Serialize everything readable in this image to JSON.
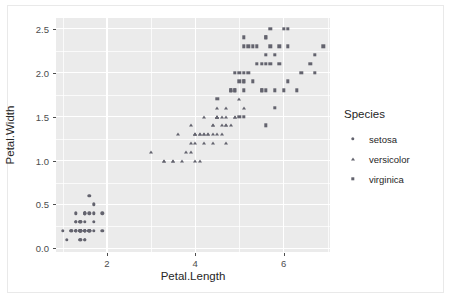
{
  "chart_data": {
    "type": "scatter",
    "title": "",
    "xlabel": "Petal.Length",
    "ylabel": "Petal.Width",
    "xlim": [
      0.85,
      7.05
    ],
    "ylim": [
      -0.04,
      2.62
    ],
    "xticks": [
      2,
      4,
      6
    ],
    "xtick_labels": [
      "2",
      "4",
      "6"
    ],
    "yticks": [
      0.0,
      0.5,
      1.0,
      1.5,
      2.0,
      2.5
    ],
    "ytick_labels": [
      "0.0",
      "0.5",
      "1.0",
      "1.5",
      "2.0",
      "2.5"
    ],
    "x_minor_ticks": [
      1,
      3,
      5,
      7
    ],
    "y_minor_ticks": [
      0.25,
      0.75,
      1.25,
      1.75,
      2.25
    ],
    "grid": true,
    "panel_background": "#ebebeb",
    "grid_color": "#ffffff",
    "marker_color": "#63636e",
    "legend_position": "right",
    "legend_title": "Species",
    "series": [
      {
        "name": "setosa",
        "marker": "circle",
        "points": [
          [
            1.4,
            0.2
          ],
          [
            1.4,
            0.2
          ],
          [
            1.3,
            0.2
          ],
          [
            1.5,
            0.2
          ],
          [
            1.4,
            0.2
          ],
          [
            1.7,
            0.4
          ],
          [
            1.4,
            0.3
          ],
          [
            1.5,
            0.2
          ],
          [
            1.4,
            0.2
          ],
          [
            1.5,
            0.1
          ],
          [
            1.5,
            0.2
          ],
          [
            1.6,
            0.2
          ],
          [
            1.4,
            0.1
          ],
          [
            1.1,
            0.1
          ],
          [
            1.2,
            0.2
          ],
          [
            1.5,
            0.4
          ],
          [
            1.3,
            0.4
          ],
          [
            1.4,
            0.3
          ],
          [
            1.7,
            0.3
          ],
          [
            1.5,
            0.3
          ],
          [
            1.7,
            0.2
          ],
          [
            1.5,
            0.4
          ],
          [
            1.0,
            0.2
          ],
          [
            1.7,
            0.5
          ],
          [
            1.9,
            0.2
          ],
          [
            1.6,
            0.2
          ],
          [
            1.6,
            0.4
          ],
          [
            1.5,
            0.2
          ],
          [
            1.4,
            0.2
          ],
          [
            1.6,
            0.2
          ],
          [
            1.6,
            0.2
          ],
          [
            1.5,
            0.4
          ],
          [
            1.5,
            0.1
          ],
          [
            1.4,
            0.2
          ],
          [
            1.5,
            0.2
          ],
          [
            1.2,
            0.2
          ],
          [
            1.3,
            0.2
          ],
          [
            1.4,
            0.1
          ],
          [
            1.3,
            0.2
          ],
          [
            1.5,
            0.2
          ],
          [
            1.3,
            0.3
          ],
          [
            1.3,
            0.3
          ],
          [
            1.3,
            0.2
          ],
          [
            1.6,
            0.6
          ],
          [
            1.9,
            0.4
          ],
          [
            1.4,
            0.3
          ],
          [
            1.6,
            0.2
          ],
          [
            1.4,
            0.2
          ],
          [
            1.5,
            0.2
          ],
          [
            1.4,
            0.2
          ]
        ]
      },
      {
        "name": "versicolor",
        "marker": "triangle",
        "points": [
          [
            4.7,
            1.4
          ],
          [
            4.5,
            1.5
          ],
          [
            4.9,
            1.5
          ],
          [
            4.0,
            1.3
          ],
          [
            4.6,
            1.5
          ],
          [
            4.5,
            1.3
          ],
          [
            4.7,
            1.6
          ],
          [
            3.3,
            1.0
          ],
          [
            4.6,
            1.3
          ],
          [
            3.9,
            1.4
          ],
          [
            3.5,
            1.0
          ],
          [
            4.2,
            1.5
          ],
          [
            4.0,
            1.0
          ],
          [
            4.7,
            1.4
          ],
          [
            3.6,
            1.3
          ],
          [
            4.4,
            1.4
          ],
          [
            4.5,
            1.5
          ],
          [
            4.1,
            1.0
          ],
          [
            4.5,
            1.5
          ],
          [
            3.9,
            1.1
          ],
          [
            4.8,
            1.8
          ],
          [
            4.0,
            1.3
          ],
          [
            4.9,
            1.5
          ],
          [
            4.7,
            1.2
          ],
          [
            4.3,
            1.3
          ],
          [
            4.4,
            1.4
          ],
          [
            4.8,
            1.4
          ],
          [
            5.0,
            1.7
          ],
          [
            4.5,
            1.5
          ],
          [
            3.5,
            1.0
          ],
          [
            3.8,
            1.1
          ],
          [
            3.7,
            1.0
          ],
          [
            3.9,
            1.2
          ],
          [
            5.1,
            1.6
          ],
          [
            4.5,
            1.5
          ],
          [
            4.5,
            1.6
          ],
          [
            4.7,
            1.5
          ],
          [
            4.4,
            1.3
          ],
          [
            4.1,
            1.3
          ],
          [
            4.0,
            1.3
          ],
          [
            4.4,
            1.2
          ],
          [
            4.6,
            1.4
          ],
          [
            4.0,
            1.2
          ],
          [
            3.3,
            1.0
          ],
          [
            4.2,
            1.3
          ],
          [
            4.2,
            1.2
          ],
          [
            4.2,
            1.3
          ],
          [
            4.3,
            1.3
          ],
          [
            3.0,
            1.1
          ],
          [
            4.1,
            1.3
          ]
        ]
      },
      {
        "name": "virginica",
        "marker": "square",
        "points": [
          [
            6.0,
            2.5
          ],
          [
            5.1,
            1.9
          ],
          [
            5.9,
            2.1
          ],
          [
            5.6,
            1.8
          ],
          [
            5.8,
            2.2
          ],
          [
            6.6,
            2.1
          ],
          [
            4.5,
            1.7
          ],
          [
            6.3,
            1.8
          ],
          [
            5.8,
            1.8
          ],
          [
            6.1,
            2.5
          ],
          [
            5.1,
            2.0
          ],
          [
            5.3,
            1.9
          ],
          [
            5.5,
            2.1
          ],
          [
            5.0,
            2.0
          ],
          [
            5.1,
            2.4
          ],
          [
            5.3,
            2.3
          ],
          [
            5.5,
            1.8
          ],
          [
            6.7,
            2.2
          ],
          [
            6.9,
            2.3
          ],
          [
            5.0,
            1.5
          ],
          [
            5.7,
            2.3
          ],
          [
            4.9,
            2.0
          ],
          [
            6.7,
            2.0
          ],
          [
            4.9,
            1.8
          ],
          [
            5.7,
            2.1
          ],
          [
            6.0,
            1.8
          ],
          [
            4.8,
            1.8
          ],
          [
            4.9,
            1.8
          ],
          [
            5.6,
            2.1
          ],
          [
            5.8,
            1.6
          ],
          [
            6.1,
            1.9
          ],
          [
            6.4,
            2.0
          ],
          [
            5.6,
            2.2
          ],
          [
            5.1,
            1.5
          ],
          [
            5.6,
            1.4
          ],
          [
            6.1,
            2.3
          ],
          [
            5.6,
            2.4
          ],
          [
            5.5,
            1.8
          ],
          [
            4.8,
            1.8
          ],
          [
            5.4,
            2.1
          ],
          [
            5.6,
            2.4
          ],
          [
            5.1,
            2.3
          ],
          [
            5.1,
            1.9
          ],
          [
            5.9,
            2.3
          ],
          [
            5.7,
            2.5
          ],
          [
            5.2,
            2.3
          ],
          [
            5.0,
            1.9
          ],
          [
            5.2,
            2.0
          ],
          [
            5.4,
            2.3
          ],
          [
            5.1,
            1.8
          ]
        ]
      }
    ]
  },
  "legend": {
    "title": "Species",
    "items": [
      {
        "label": "setosa",
        "marker": "circle"
      },
      {
        "label": "versicolor",
        "marker": "triangle"
      },
      {
        "label": "virginica",
        "marker": "square"
      }
    ]
  }
}
